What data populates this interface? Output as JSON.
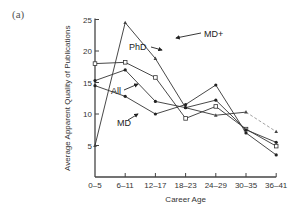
{
  "panel_label": "(a)",
  "chart_data": {
    "type": "line",
    "title": "",
    "xlabel": "Career Age",
    "ylabel": "Average Apparent Quality of Publications",
    "categories": [
      "0–5",
      "6–11",
      "12–17",
      "18–23",
      "24–29",
      "30–35",
      "36–41"
    ],
    "yticks": [
      5,
      10,
      15,
      20,
      25
    ],
    "ylim": [
      0,
      25
    ],
    "grid": false,
    "legend_position": "inline labels with arrows",
    "series": [
      {
        "name": "MD+",
        "marker": "triangle",
        "values": [
          5,
          24.5,
          18.8,
          11,
          9.8,
          10.3,
          7.2
        ],
        "last_segment_dashed": true
      },
      {
        "name": "PhD",
        "marker": "open-square",
        "values": [
          18,
          18.2,
          15.8,
          9.3,
          11.2,
          7.6,
          4.9
        ]
      },
      {
        "name": "All",
        "marker": "filled-circle",
        "values": [
          15.3,
          17,
          12,
          11,
          12.2,
          7.5,
          5.5
        ]
      },
      {
        "name": "MD",
        "marker": "filled-circle",
        "values": [
          14.5,
          12.8,
          10,
          11.5,
          14.6,
          7,
          3.5
        ]
      }
    ]
  },
  "footer_text": "Figure 11.1"
}
